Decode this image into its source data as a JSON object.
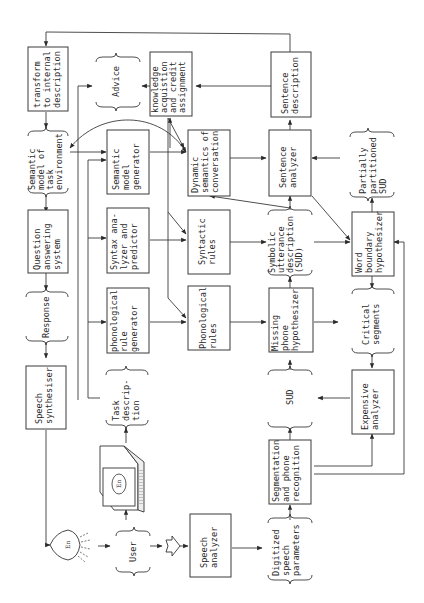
{
  "diagram": {
    "orientation": "rotated 90deg counter-clockwise (text reads bottom-to-top)",
    "nodes": {
      "transform": {
        "type": "process",
        "lines": [
          "transform",
          "to internal",
          "description"
        ]
      },
      "advice": {
        "type": "data",
        "lines": [
          "Advice"
        ]
      },
      "knowledge": {
        "type": "process",
        "lines": [
          "knowledge",
          "acquistion",
          "and credit",
          "assignment"
        ]
      },
      "sentence_description": {
        "type": "process",
        "lines": [
          "Sentence",
          "description"
        ]
      },
      "semantic_model_task": {
        "type": "data",
        "lines": [
          "Semantic",
          "model of",
          "task",
          "environment"
        ]
      },
      "semantic_model_generator": {
        "type": "process",
        "lines": [
          "Semantic",
          "model",
          "generator"
        ]
      },
      "dynamic_semantics": {
        "type": "process",
        "lines": [
          "Dynamic",
          "semantics of",
          "conversation"
        ]
      },
      "sentence_analyzer": {
        "type": "process",
        "lines": [
          "Sentence",
          "analyzer"
        ]
      },
      "partially_partitioned_sud": {
        "type": "data",
        "lines": [
          "Partially",
          "partitioned",
          "SUD"
        ]
      },
      "question_answering": {
        "type": "process",
        "lines": [
          "Question",
          "answering",
          "system"
        ]
      },
      "syntax_analyzer": {
        "type": "process",
        "lines": [
          "Syntax ana-",
          "lyzer and",
          "predictor"
        ]
      },
      "syntactic_rules": {
        "type": "process",
        "lines": [
          "Syntactic",
          "rules"
        ]
      },
      "sud": {
        "type": "data",
        "lines": [
          "Symbolic",
          "utterance",
          "description",
          "(SUD)"
        ]
      },
      "word_boundary": {
        "type": "process",
        "lines": [
          "Word",
          "boundary",
          "hypothesizer"
        ]
      },
      "response": {
        "type": "data",
        "lines": [
          "Response"
        ]
      },
      "phonological_rule_generator": {
        "type": "process",
        "lines": [
          "phonological",
          "rule",
          "generator"
        ]
      },
      "phonological_rules": {
        "type": "process",
        "lines": [
          "Phonological",
          "rules"
        ]
      },
      "missing_phone": {
        "type": "process",
        "lines": [
          "Missing",
          "phone",
          "hypothesizer"
        ]
      },
      "critical_segments": {
        "type": "data",
        "lines": [
          "Critical",
          "segments"
        ]
      },
      "speech_synthesizer": {
        "type": "process",
        "lines": [
          "Speech",
          "synthesiser"
        ]
      },
      "task_description": {
        "type": "data",
        "lines": [
          "Task",
          "descrip-",
          "tion"
        ]
      },
      "sud_small": {
        "type": "data",
        "lines": [
          "SUD"
        ]
      },
      "expensive_analyzer": {
        "type": "process",
        "lines": [
          "Expensive",
          "analyzer"
        ]
      },
      "segmentation": {
        "type": "process",
        "lines": [
          "Segmentation",
          "and phone",
          "recognition"
        ]
      },
      "user": {
        "type": "data",
        "lines": [
          "User"
        ]
      },
      "speech_analyzer": {
        "type": "process",
        "lines": [
          "Speech",
          "analyzer"
        ]
      },
      "digitized": {
        "type": "data",
        "lines": [
          "Digitized",
          "speech",
          "parameters"
        ]
      }
    },
    "icons": {
      "terminal_label": "En",
      "speaker_label": "En"
    }
  }
}
